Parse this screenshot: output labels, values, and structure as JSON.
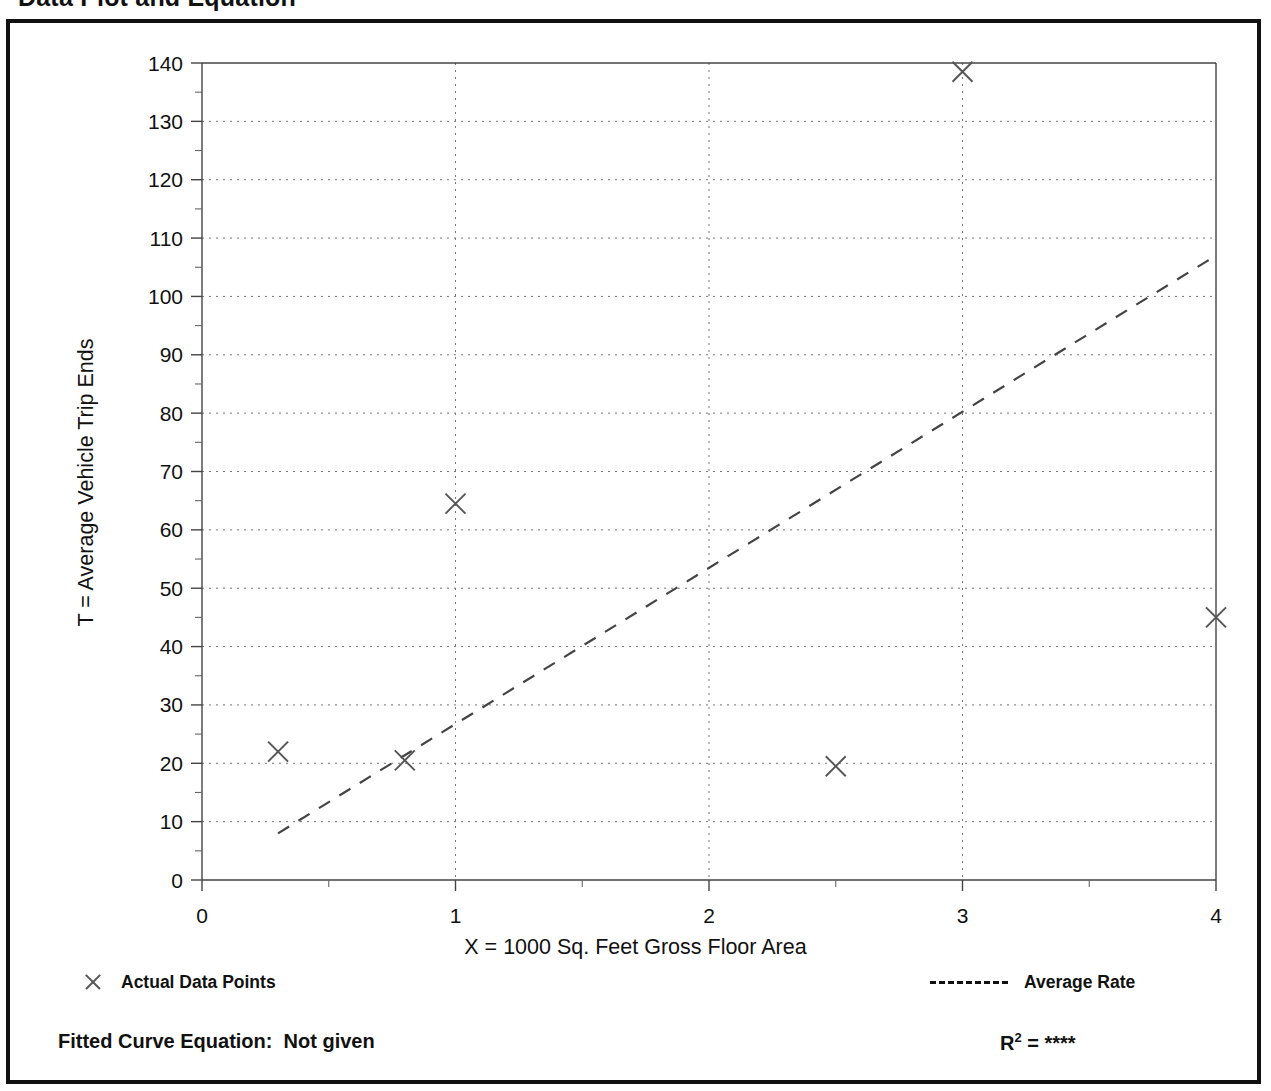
{
  "page": {
    "title": "Data Plot and Equation"
  },
  "axes": {
    "xlabel": "X = 1000 Sq. Feet Gross Floor Area",
    "ylabel": "T = Average Vehicle Trip Ends"
  },
  "legend": {
    "data_points_label": "Actual Data Points",
    "data_points_marker": "x-marker-icon",
    "average_rate_label": "Average Rate",
    "average_rate_marker": "dashed-line-icon"
  },
  "equation": {
    "label": "Fitted Curve Equation:",
    "value": "Not given",
    "r_symbol": "R",
    "r_exponent": "2",
    "r_equals": "=",
    "r_value": "****"
  },
  "chart_data": {
    "type": "scatter",
    "title": "Data Plot and Equation",
    "xlabel": "X = 1000 Sq. Feet Gross Floor Area",
    "ylabel": "T = Average Vehicle Trip Ends",
    "xlim": [
      0,
      4
    ],
    "ylim": [
      0,
      140
    ],
    "xticks": [
      0,
      1,
      2,
      3,
      4
    ],
    "xtick_labels": [
      "0",
      "1",
      "2",
      "3",
      "4"
    ],
    "xminor_step": 0.5,
    "yticks": [
      0,
      10,
      20,
      30,
      40,
      50,
      60,
      70,
      80,
      90,
      100,
      110,
      120,
      130,
      140
    ],
    "ytick_labels": [
      "0",
      "10",
      "20",
      "30",
      "40",
      "50",
      "60",
      "70",
      "80",
      "90",
      "100",
      "110",
      "120",
      "130",
      "140"
    ],
    "yminor_step": 5,
    "grid": "dotted-both",
    "legend_position": "below-plot",
    "series": [
      {
        "name": "Actual Data Points",
        "type": "scatter",
        "marker": "x",
        "color": "#555555",
        "points": [
          {
            "x": 0.3,
            "y": 22.0
          },
          {
            "x": 0.8,
            "y": 20.5
          },
          {
            "x": 1.0,
            "y": 64.5
          },
          {
            "x": 2.5,
            "y": 19.5
          },
          {
            "x": 3.0,
            "y": 138.5
          },
          {
            "x": 4.0,
            "y": 45.0
          }
        ]
      },
      {
        "name": "Average Rate",
        "type": "line",
        "style": "dashed",
        "color": "#444444",
        "points": [
          {
            "x": 0.3,
            "y": 8.0
          },
          {
            "x": 4.0,
            "y": 107.0
          }
        ]
      }
    ],
    "annotations": [
      {
        "text": "Fitted Curve Equation:  Not given"
      },
      {
        "text": "R2 = ****"
      }
    ]
  }
}
